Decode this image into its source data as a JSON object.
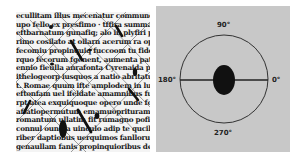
{
  "figure": {
    "left_panel": {
      "description": "Scanned degraded Latin text with overlaid detected stroke lines and marks",
      "text_lines": [
        "ecullitam illus mecenatur communem dedufo",
        "upo fello ex presfimo · tffira summa abbo fugg",
        "eftbarnatum gunafiq; alo in plyfiri pratetpa of",
        "rimo cosilato at oilarn acerum ra opfiasmonmi",
        "fecomiu propinquiq fuccoom tu fidem ac robes",
        "rquo fecorum fgenent, aumenta patrahoru pros",
        "ennio fieulla anrafonta Cyrenaida praenature,",
        "ithelogeorp iusquos a natio abritatumbis pri",
        "t. Romae quum ifte amplodem in luna huius f",
        "eftonfam uel ifeldate amamnibus futthe in",
        "rpt atea exquiquoque opero unde fortune em",
        "affatiopermutum emamuoprituram mannfoctip",
        "romantum ullatim fit rumagno pofieamcumba",
        "connul oundia uinculo adip te qucilamofellos",
        "riber daptiobus uerquimos fanllorum gratia e",
        "genaullam fanis propinquioribus degeneratio"
      ],
      "marks": "diagonal-lines-and-dark-streaks"
    },
    "right_panel": {
      "description": "Polar orientation diagram with central blob and horizontal axis line",
      "background_color": "#c8c8c8",
      "circle_color": "#333333",
      "blob_color": "#111111",
      "angle_labels": {
        "top": "90°",
        "left": "180°",
        "right": "0°",
        "bottom": "270°"
      }
    }
  }
}
